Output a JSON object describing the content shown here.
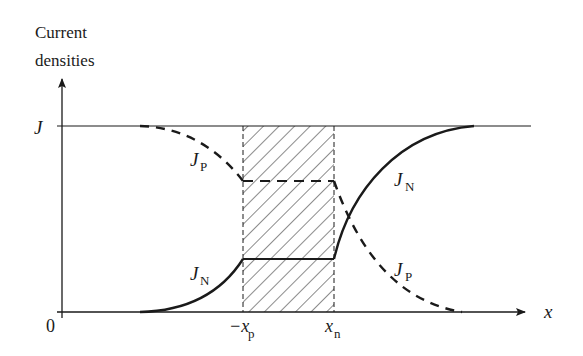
{
  "diagram": {
    "y_axis_label_line1": "Current",
    "y_axis_label_line2": "densities",
    "x_axis_label": "x",
    "origin_label": "0",
    "j_level_label": "J",
    "labels": {
      "jp_left": {
        "main": "J",
        "sub": "P"
      },
      "jn_right": {
        "main": "J",
        "sub": "N"
      },
      "jn_left": {
        "main": "J",
        "sub": "N"
      },
      "jp_right": {
        "main": "J",
        "sub": "P"
      }
    },
    "tick_neg_xp": {
      "main": "−x",
      "sub": "p"
    },
    "tick_xn": {
      "main": "x",
      "sub": "n"
    },
    "depletion_region": "hatched region between −x_p and x_n",
    "curves": [
      {
        "name": "J_P",
        "style": "dashed",
        "description": "hole current: J at left, decays to constant in depletion region, decays to 0 at right"
      },
      {
        "name": "J_N",
        "style": "solid",
        "description": "electron current: 0 at left, rises to constant in depletion region, rises to J at right"
      }
    ],
    "colors": {
      "ink": "#1a1a1a",
      "background": "#ffffff"
    }
  }
}
